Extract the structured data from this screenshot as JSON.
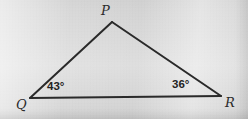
{
  "figure": {
    "type": "geometry-diagram",
    "shape": "triangle",
    "background_color": "#d9d9d9",
    "stroke_color": "#2a2a2a",
    "stroke_width": 2,
    "vertices": [
      {
        "id": "P",
        "label": "P",
        "x": 112,
        "y": 22,
        "label_x": 101,
        "label_y": 4
      },
      {
        "id": "Q",
        "label": "Q",
        "x": 30,
        "y": 98,
        "label_x": 16,
        "label_y": 98
      },
      {
        "id": "R",
        "label": "R",
        "x": 221,
        "y": 96,
        "label_x": 225,
        "label_y": 96
      }
    ],
    "sides": [
      {
        "id": "PQ",
        "from": "P",
        "to": "Q"
      },
      {
        "id": "PR",
        "from": "P",
        "to": "R"
      },
      {
        "id": "QR",
        "from": "Q",
        "to": "R"
      }
    ],
    "angles": [
      {
        "id": "angle-Q",
        "at_vertex": "Q",
        "value": 43,
        "unit": "°",
        "text": "43°",
        "label_x": 47,
        "label_y": 81
      },
      {
        "id": "angle-R",
        "at_vertex": "R",
        "value": 36,
        "unit": "°",
        "text": "36°",
        "label_x": 172,
        "label_y": 79
      }
    ]
  }
}
